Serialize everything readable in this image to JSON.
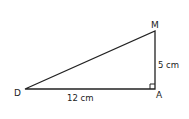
{
  "diagram": {
    "type": "right-triangle",
    "vertices": {
      "D": {
        "label": "D",
        "x": 25,
        "y": 89
      },
      "A": {
        "label": "A",
        "x": 155,
        "y": 89
      },
      "M": {
        "label": "M",
        "x": 155,
        "y": 31
      }
    },
    "sides": {
      "DA": {
        "label": "12 cm"
      },
      "AM": {
        "label": "5 cm"
      }
    },
    "right_angle_at": "A",
    "stroke_color": "#222222"
  }
}
